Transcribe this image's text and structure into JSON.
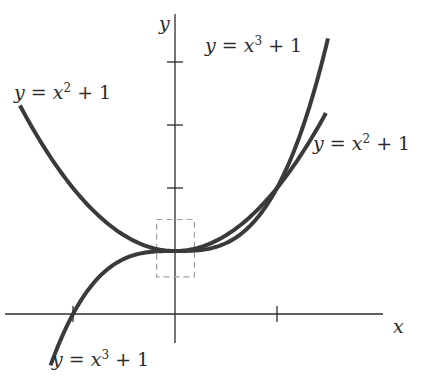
{
  "figure": {
    "type": "function-graph",
    "axes": {
      "x_label": "x",
      "y_label": "y",
      "x_ticks": [
        -1,
        1
      ],
      "y_ticks": [
        1,
        2,
        3,
        4
      ],
      "x_range": [
        -1.7,
        2.0
      ],
      "y_range": [
        -1.0,
        4.9
      ]
    },
    "curves": [
      {
        "name": "parabola",
        "label_lhs": "y",
        "label_eq": "=",
        "label_var": "x",
        "label_exp": "2",
        "label_rest": "+ 1",
        "x_domain": [
          -1.52,
          1.48
        ],
        "color": "#3a3a3a"
      },
      {
        "name": "cubic",
        "label_lhs": "y",
        "label_eq": "=",
        "label_var": "x",
        "label_exp": "3",
        "label_rest": "+ 1",
        "x_domain": [
          -1.22,
          1.5
        ],
        "color": "#3a3a3a"
      }
    ],
    "zoom_box": {
      "description": "dashed rectangle around (0, 1)",
      "x_range": [
        -0.18,
        0.19
      ],
      "y_range": [
        0.59,
        1.5
      ],
      "color": "#a0a0a0"
    }
  },
  "chart_data": {
    "type": "line",
    "title": "",
    "xlabel": "x",
    "ylabel": "y",
    "series": [
      {
        "name": "y = x^2 + 1",
        "x": [
          -1.5,
          -1.0,
          -0.5,
          0,
          0.5,
          1.0,
          1.47
        ],
        "y": [
          3.25,
          2.0,
          1.25,
          1.0,
          1.25,
          2.0,
          3.16
        ]
      },
      {
        "name": "y = x^3 + 1",
        "x": [
          -1.22,
          -1.0,
          -0.5,
          0,
          0.5,
          1.0,
          1.5
        ],
        "y": [
          -0.82,
          0.0,
          0.875,
          1.0,
          1.125,
          2.0,
          4.375
        ]
      }
    ],
    "x_ticks": [
      -1,
      1
    ],
    "y_ticks": [
      1,
      2,
      3,
      4
    ],
    "annotations": [
      "y = x^2 + 1 (upper left)",
      "y = x^3 + 1 (top right)",
      "y = x^2 + 1 (right)",
      "y = x^3 + 1 (bottom left)",
      "dashed box around point (0, 1)"
    ]
  },
  "labels": {
    "parabola_left": {
      "lhs": "y",
      "eq": " = ",
      "var": "x",
      "exp": "2",
      "rest": " + 1"
    },
    "cubic_top": {
      "lhs": "y",
      "eq": " = ",
      "var": "x",
      "exp": "3",
      "rest": " + 1"
    },
    "parabola_right": {
      "lhs": "y",
      "eq": " = ",
      "var": "x",
      "exp": "2",
      "rest": " + 1"
    },
    "cubic_bottom": {
      "lhs": "y",
      "eq": " = ",
      "var": "x",
      "exp": "3",
      "rest": " + 1"
    },
    "x_axis": "x",
    "y_axis": "y"
  }
}
